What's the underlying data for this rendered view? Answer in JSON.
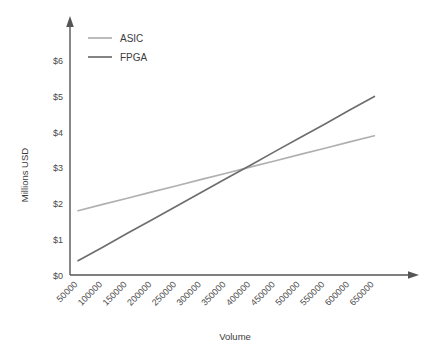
{
  "chart_data": {
    "type": "line",
    "title": "",
    "subtitle": "",
    "xlabel": "Volume",
    "ylabel": "Millions USD",
    "x": [
      50000,
      100000,
      150000,
      200000,
      250000,
      300000,
      350000,
      400000,
      450000,
      500000,
      550000,
      600000,
      650000
    ],
    "xtick_labels": [
      "50000",
      "100000",
      "150000",
      "200000",
      "250000",
      "300000",
      "350000",
      "400000",
      "450000",
      "500000",
      "550000",
      "600000",
      "650000"
    ],
    "ytick_labels": [
      "$0",
      "$1",
      "$2",
      "$3",
      "$4",
      "$5",
      "$6"
    ],
    "ytick_values": [
      0,
      1,
      2,
      3,
      4,
      5,
      6
    ],
    "xlim": [
      50000,
      650000
    ],
    "ylim": [
      0,
      6
    ],
    "grid": false,
    "legend_position": "top-left",
    "xtick_rotation_deg": 45,
    "series": [
      {
        "name": "ASIC",
        "color": "#b0b0b0",
        "values": [
          1.8,
          1.98,
          2.15,
          2.33,
          2.5,
          2.68,
          2.85,
          3.03,
          3.2,
          3.38,
          3.55,
          3.73,
          3.9
        ]
      },
      {
        "name": "FPGA",
        "color": "#6e6e6e",
        "values": [
          0.4,
          0.78,
          1.17,
          1.55,
          1.93,
          2.32,
          2.7,
          3.08,
          3.47,
          3.85,
          4.23,
          4.62,
          5.0
        ]
      }
    ],
    "axis_color": "#555555",
    "annotations": []
  },
  "legend": {
    "items": [
      {
        "label": "ASIC"
      },
      {
        "label": "FPGA"
      }
    ]
  },
  "axes": {
    "y_title": "Millions USD",
    "x_title": "Volume"
  }
}
